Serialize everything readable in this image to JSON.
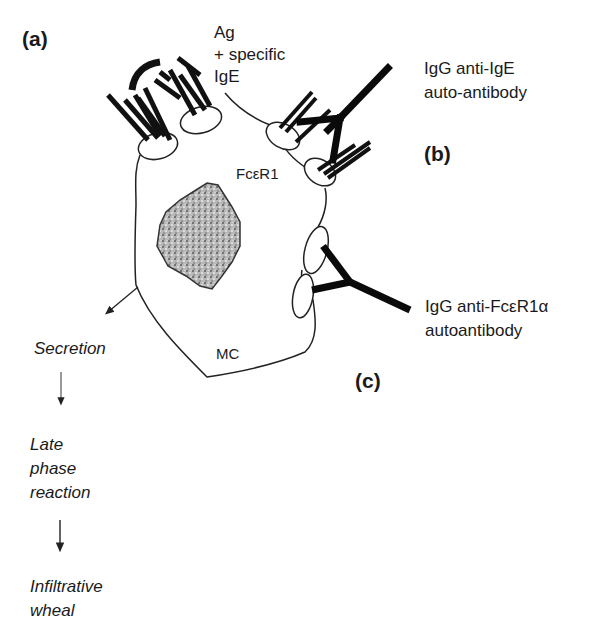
{
  "figure": {
    "panels": {
      "a": "(a)",
      "b": "(b)",
      "c": "(c)"
    },
    "labels": {
      "antigen_line1": "Ag",
      "antigen_line2": "+ specific",
      "antigen_line3": "IgE",
      "anti_ige_line1": "IgG anti-IgE",
      "anti_ige_line2": "auto-antibody",
      "receptor": "FcεR1",
      "cell": "MC",
      "anti_fcer_line1": "IgG anti-FcεR1α",
      "anti_fcer_line2": "autoantibody"
    },
    "cascade": {
      "step1": "Secretion",
      "step2_line1": "Late",
      "step2_line2": "phase",
      "step2_line3": "reaction",
      "step3_line1": "Infiltrative",
      "step3_line2": "wheal"
    },
    "colors": {
      "ink": "#1a1a1a",
      "nucleus": "#8a8a8a",
      "background": "#ffffff"
    }
  }
}
